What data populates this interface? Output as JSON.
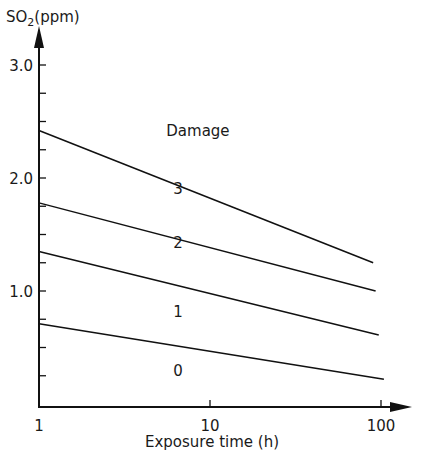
{
  "chart_data": {
    "type": "line",
    "title": "",
    "xlabel": "Exposure time (h)",
    "ylabel": "SO2(ppm)",
    "ylabel_parts": {
      "main": "SO",
      "sub": "2",
      "unit": "(ppm)"
    },
    "x_scale": "log",
    "xlim": [
      1,
      100
    ],
    "ylim": [
      0,
      3.0
    ],
    "x_ticks": [
      1,
      10,
      100
    ],
    "x_tick_labels": [
      "1",
      "10",
      "100"
    ],
    "y_ticks": [
      1.0,
      2.0,
      3.0
    ],
    "y_tick_labels": [
      "1.0",
      "2.0",
      "3.0"
    ],
    "y_minor_tick_step": 0.25,
    "grid": false,
    "legend": null,
    "series": [
      {
        "name": "boundary 0/1",
        "x": [
          1,
          104
        ],
        "y": [
          0.71,
          0.22
        ]
      },
      {
        "name": "boundary 1/2",
        "x": [
          1,
          97
        ],
        "y": [
          1.35,
          0.61
        ]
      },
      {
        "name": "boundary 2/3",
        "x": [
          1,
          93
        ],
        "y": [
          1.78,
          1.0
        ]
      },
      {
        "name": "boundary 3/Damage",
        "x": [
          1,
          90
        ],
        "y": [
          2.42,
          1.25
        ]
      }
    ],
    "annotations": [
      {
        "text": "0",
        "x": 6.5,
        "y": 0.25
      },
      {
        "text": "1",
        "x": 6.5,
        "y": 0.77
      },
      {
        "text": "2",
        "x": 6.5,
        "y": 1.38
      },
      {
        "text": "3",
        "x": 6.5,
        "y": 1.86
      },
      {
        "text": "Damage",
        "x": 8.5,
        "y": 2.37
      }
    ]
  }
}
